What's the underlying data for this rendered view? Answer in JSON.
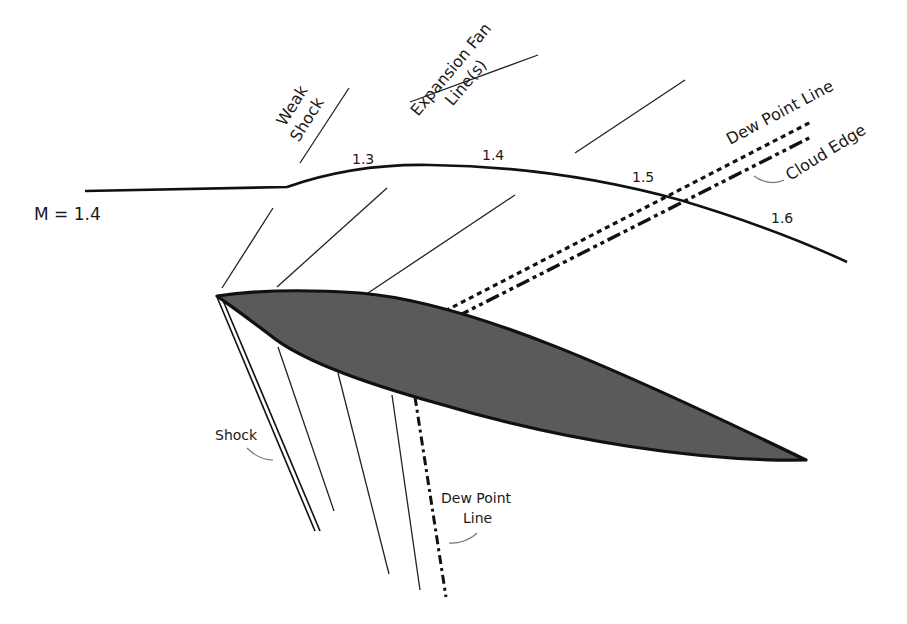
{
  "diagram": {
    "freestream_label": "M = 1.4",
    "mach_labels": [
      "1.3",
      "1.4",
      "1.5",
      "1.6"
    ],
    "labels": {
      "weak_shock_line1": "Weak",
      "weak_shock_line2": "Shock",
      "expansion_fan_line1": "Expansion Fan",
      "expansion_fan_line2": "Line(s)",
      "dew_point_upper": "Dew Point Line",
      "cloud_edge": "Cloud Edge",
      "shock": "Shock",
      "dew_point_lower_line1": "Dew Point",
      "dew_point_lower_line2": "Line"
    },
    "colors": {
      "airfoil_fill": "#5a5a5a",
      "line": "#111111",
      "leader": "#777777"
    }
  }
}
